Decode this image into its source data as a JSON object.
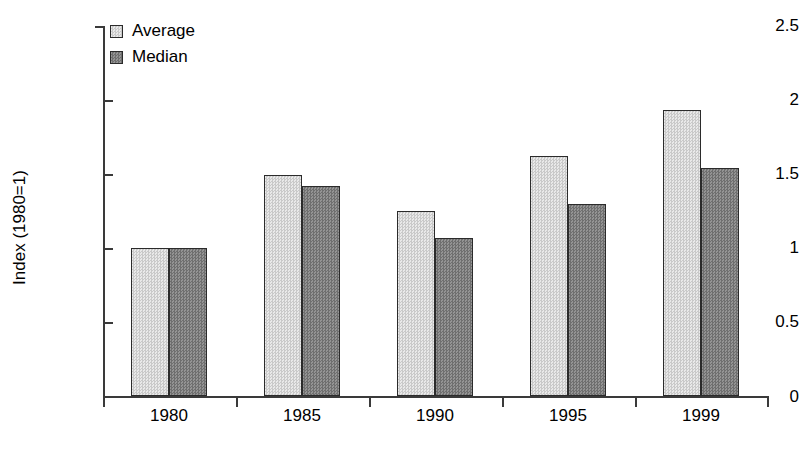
{
  "chart_data": {
    "type": "bar",
    "title": "",
    "subtitle": "",
    "xlabel": "",
    "ylabel": "Index (1980=1)",
    "categories": [
      "1980",
      "1985",
      "1990",
      "1995",
      "1999"
    ],
    "series": [
      {
        "name": "Average",
        "values": [
          1.0,
          1.49,
          1.25,
          1.62,
          1.93
        ],
        "color": "#d9d9d9"
      },
      {
        "name": "Median",
        "values": [
          1.0,
          1.42,
          1.07,
          1.3,
          1.54
        ],
        "color": "#808080"
      }
    ],
    "ylim": [
      0,
      2.5
    ],
    "yticks": [
      "0",
      "0.5",
      "1",
      "1.5",
      "2",
      "2.5"
    ],
    "ytick_values": [
      0,
      0.5,
      1,
      1.5,
      2,
      2.5
    ],
    "grid": false,
    "legend_position": "top-left",
    "legend_entries": [
      "Average",
      "Median"
    ],
    "annotations": [],
    "axis_color": "#3a3a3a",
    "bar_edge_color": "#2b2b2b"
  }
}
